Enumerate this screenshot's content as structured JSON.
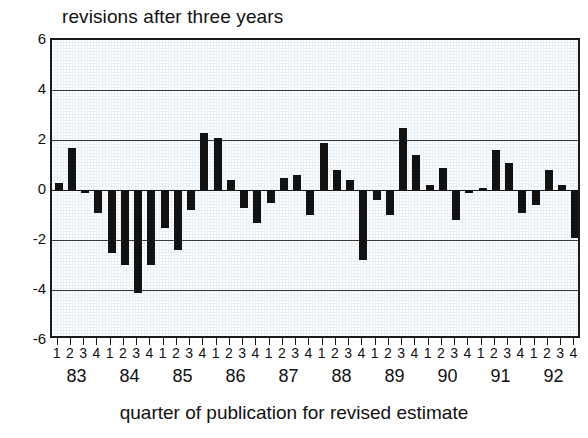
{
  "chart_data": {
    "type": "bar",
    "title": "revisions after three years",
    "xlabel": "quarter of publication for revised estimate",
    "ylabel": "",
    "ylim": [
      -6,
      6
    ],
    "yticks": [
      6,
      4,
      2,
      0,
      -2,
      -4,
      -6
    ],
    "ytick_labels": [
      "6",
      "4",
      "2",
      "0",
      "-2",
      "-4",
      "-6"
    ],
    "grid": true,
    "gridlines": [
      4,
      2,
      0,
      -2,
      -4
    ],
    "legend": "none",
    "years": [
      "83",
      "84",
      "85",
      "86",
      "87",
      "88",
      "89",
      "90",
      "91",
      "92"
    ],
    "quarters": [
      "1",
      "2",
      "3",
      "4"
    ],
    "categories": [
      "83Q1",
      "83Q2",
      "83Q3",
      "83Q4",
      "84Q1",
      "84Q2",
      "84Q3",
      "84Q4",
      "85Q1",
      "85Q2",
      "85Q3",
      "85Q4",
      "86Q1",
      "86Q2",
      "86Q3",
      "86Q4",
      "87Q1",
      "87Q2",
      "87Q3",
      "87Q4",
      "88Q1",
      "88Q2",
      "88Q3",
      "88Q4",
      "89Q1",
      "89Q2",
      "89Q3",
      "89Q4",
      "90Q1",
      "90Q2",
      "90Q3",
      "90Q4",
      "91Q1",
      "91Q2",
      "91Q3",
      "91Q4",
      "92Q1",
      "92Q2",
      "92Q3",
      "92Q4"
    ],
    "values": [
      0.3,
      1.7,
      -0.1,
      -0.9,
      -2.5,
      -3.0,
      -4.1,
      -3.0,
      -1.5,
      -2.4,
      -0.8,
      2.3,
      2.1,
      0.4,
      -0.7,
      -1.3,
      -0.5,
      0.5,
      0.6,
      -1.0,
      1.9,
      0.8,
      0.4,
      -2.8,
      -0.4,
      -1.0,
      2.5,
      1.4,
      0.2,
      0.9,
      -1.2,
      -0.1,
      0.1,
      1.6,
      1.1,
      -0.9,
      -0.6,
      0.8,
      0.2,
      -1.9
    ],
    "bar_color": "#121212",
    "plot_background": "#e7f0f7",
    "axis_color": "#1a1a1a"
  }
}
